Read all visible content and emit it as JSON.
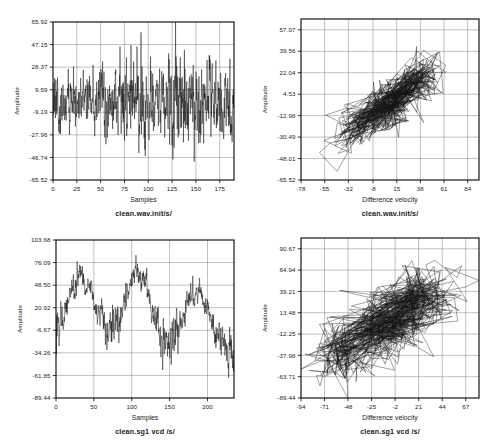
{
  "page": {
    "background": "#ffffff",
    "ink": "#141414",
    "grid_color": "#6f6f6f",
    "width": 490,
    "height": 441,
    "layout": "2x2 grid of plots"
  },
  "panels": [
    {
      "id": "top-left",
      "name": "clean-wav-init-waveform",
      "caption": "clean.wav.init/s/",
      "xlabel": "Samples",
      "ylabel": "Amplitude",
      "xticks": [
        "0",
        "25",
        "50",
        "75",
        "100",
        "125",
        "150",
        "175"
      ],
      "yticks": [
        "65.92",
        "47.15",
        "28.37",
        "9.59",
        "-9.19",
        "-27.96",
        "-46.74",
        "-65.52"
      ],
      "box": {
        "x": 53,
        "y": 22,
        "w": 181,
        "h": 158
      }
    },
    {
      "id": "top-right",
      "name": "clean-wav-init-phase",
      "caption": "clean.wav.init/s/",
      "xlabel": "Difference velocity",
      "ylabel": "Amplitude",
      "xticks": [
        "-78",
        "-55",
        "-32",
        "-8",
        "15",
        "38",
        "61",
        "84"
      ],
      "yticks": [
        "57.07",
        "39.56",
        "22.04",
        "4.53",
        "-12.98",
        "-30.49",
        "-48.01",
        "-65.52"
      ],
      "box": {
        "x": 301,
        "y": 19,
        "w": 178,
        "h": 161
      }
    },
    {
      "id": "bottom-left",
      "name": "clean-sg1-vcd-waveform",
      "caption": "clean.sg1 vcd /s/",
      "xlabel": "Samples",
      "ylabel": "Amplitude",
      "xticks": [
        "0",
        "50",
        "100",
        "150",
        "200"
      ],
      "yticks": [
        "103.68",
        "76.09",
        "48.50",
        "20.92",
        "-6.67",
        "-34.26",
        "-61.85",
        "-89.44"
      ],
      "box": {
        "x": 56,
        "y": 240,
        "w": 178,
        "h": 158
      }
    },
    {
      "id": "bottom-right",
      "name": "clean-sg1-vcd-phase",
      "caption": "clean.sg1 vcd /s/",
      "xlabel": "Difference velocity",
      "ylabel": "Amplitude",
      "xticks": [
        "-94",
        "-71",
        "-48",
        "-25",
        "-2",
        "21",
        "44",
        "67"
      ],
      "yticks": [
        "90.67",
        "64.94",
        "39.21",
        "13.48",
        "-12.25",
        "-37.98",
        "-63.71",
        "-89.44"
      ],
      "box": {
        "x": 301,
        "y": 238,
        "w": 178,
        "h": 160
      }
    }
  ],
  "chart_data": [
    {
      "type": "line",
      "id": "top-left",
      "title": "clean.wav.init/s/",
      "xlabel": "Samples",
      "ylabel": "Amplitude",
      "xlim": [
        0,
        190
      ],
      "ylim": [
        -65.52,
        65.92
      ],
      "grid": true,
      "legend": "none",
      "xticks": [
        0,
        25,
        50,
        75,
        100,
        125,
        150,
        175
      ],
      "yticks": [
        65.92,
        47.15,
        28.37,
        9.59,
        -9.19,
        -27.96,
        -46.74,
        -65.52
      ],
      "description": "Dense noise-like speech waveform, roughly zero mean, amplitude mostly within +/-40 with spikes to +66 near sample 124 and to -65 near sample 136",
      "synth": {
        "model": "noise_burst",
        "n": 760,
        "seed": 20113,
        "base_sigma": 14.0,
        "envelope_knots": [
          [
            0.0,
            0.95
          ],
          [
            0.04,
            1.25
          ],
          [
            0.08,
            0.8
          ],
          [
            0.13,
            1.05
          ],
          [
            0.17,
            0.7
          ],
          [
            0.21,
            0.95
          ],
          [
            0.25,
            1.25
          ],
          [
            0.29,
            1.45
          ],
          [
            0.33,
            1.0
          ],
          [
            0.37,
            1.35
          ],
          [
            0.41,
            1.55
          ],
          [
            0.45,
            1.2
          ],
          [
            0.49,
            1.7
          ],
          [
            0.53,
            1.35
          ],
          [
            0.57,
            1.0
          ],
          [
            0.61,
            1.3
          ],
          [
            0.65,
            1.75
          ],
          [
            0.68,
            2.3
          ],
          [
            0.72,
            1.3
          ],
          [
            0.76,
            1.6
          ],
          [
            0.8,
            1.95
          ],
          [
            0.84,
            1.1
          ],
          [
            0.88,
            1.55
          ],
          [
            0.92,
            1.15
          ],
          [
            0.96,
            1.3
          ],
          [
            1.0,
            1.4
          ]
        ],
        "clip": [
          -65.52,
          65.92
        ]
      }
    },
    {
      "type": "line",
      "id": "top-right",
      "title": "clean.wav.init/s/",
      "xlabel": "Difference velocity",
      "ylabel": "Amplitude",
      "xlim": [
        -78,
        95
      ],
      "ylim": [
        -65.52,
        65.92
      ],
      "grid": true,
      "legend": "none",
      "xticks": [
        -78,
        -55,
        -32,
        -8,
        15,
        38,
        61,
        84
      ],
      "yticks": [
        57.07,
        39.56,
        22.04,
        4.53,
        -12.98,
        -30.49,
        -48.01,
        -65.52
      ],
      "description": "Phase-space (amplitude vs difference velocity) scatter-trajectory of the clean.wav.init signal; dense elongated cloud oriented along a positive diagonal",
      "synth": {
        "model": "phase_portrait",
        "n": 620,
        "seed": 77021,
        "slope": 0.62,
        "spread_major": 46.0,
        "spread_minor": 15.0,
        "cx": 4.0,
        "cy": -5.0,
        "jump_prob": 0.16
      }
    },
    {
      "type": "line",
      "id": "bottom-left",
      "title": "clean.sg1 vcd /s/",
      "xlabel": "Samples",
      "ylabel": "Amplitude",
      "xlim": [
        0,
        235
      ],
      "ylim": [
        -89.44,
        103.68
      ],
      "grid": true,
      "legend": "none",
      "xticks": [
        0,
        50,
        100,
        150,
        200
      ],
      "yticks": [
        103.68,
        76.09,
        48.5,
        20.92,
        -6.67,
        -34.26,
        -61.85,
        -89.44
      ],
      "description": "Quasi-periodic voiced signal with three large positive lobes peaking near samples 33, 110 and 190 (peaks ~95, ~100, ~75) separated by noisy low plateaus near -35",
      "synth": {
        "model": "quasi_periodic",
        "n": 700,
        "seed": 31477,
        "period_frac": 0.335,
        "peak_centers": [
          0.14,
          0.46,
          0.79
        ],
        "peak_heights": [
          92.0,
          98.0,
          74.0
        ],
        "peak_widths": [
          0.085,
          0.075,
          0.075
        ],
        "baseline": -34.0,
        "noise_sigma": 11.0,
        "clip": [
          -89.44,
          103.68
        ]
      }
    },
    {
      "type": "line",
      "id": "bottom-right",
      "title": "clean.sg1 vcd /s/",
      "xlabel": "Difference velocity",
      "ylabel": "Amplitude",
      "xlim": [
        -94,
        80
      ],
      "ylim": [
        -89.44,
        103.68
      ],
      "grid": true,
      "legend": "none",
      "xticks": [
        -94,
        -71,
        -48,
        -25,
        -2,
        21,
        44,
        67
      ],
      "yticks": [
        90.67,
        64.94,
        39.21,
        13.48,
        -12.25,
        -37.98,
        -63.71,
        -89.44
      ],
      "description": "Phase portrait of clean.sg1 vcd: wide band of long, nearly parallel streaks with positive slope spanning the full plot, densest in the lower middle",
      "synth": {
        "model": "phase_portrait",
        "n": 660,
        "seed": 90233,
        "slope": 0.95,
        "spread_major": 52.0,
        "spread_minor": 26.0,
        "cx": -10.0,
        "cy": 2.0,
        "jump_prob": 0.3
      }
    }
  ]
}
